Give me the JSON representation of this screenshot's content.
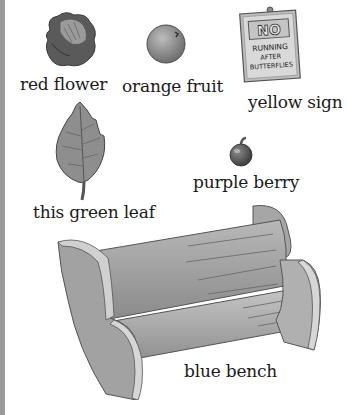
{
  "items": [
    {
      "id": "flower",
      "label": "red flower",
      "icon": "flower-icon"
    },
    {
      "id": "fruit",
      "label": "orange fruit",
      "icon": "orange-fruit-icon"
    },
    {
      "id": "sign",
      "label": "yellow sign",
      "icon": "sign-icon",
      "sign_text": {
        "line1": "NO",
        "line2": "RUNNING",
        "line3": "AFTER",
        "line4": "BUTTERFLIES"
      }
    },
    {
      "id": "leaf",
      "label": "this green leaf",
      "icon": "leaf-icon"
    },
    {
      "id": "berry",
      "label": "purple berry",
      "icon": "berry-icon"
    },
    {
      "id": "bench",
      "label": "blue bench",
      "icon": "bench-icon"
    }
  ],
  "colors": {
    "background": "#ffffff",
    "text": "#1a1a1a",
    "edge": "#9a9a9a",
    "illustration_gray": "#8a8a8a"
  }
}
